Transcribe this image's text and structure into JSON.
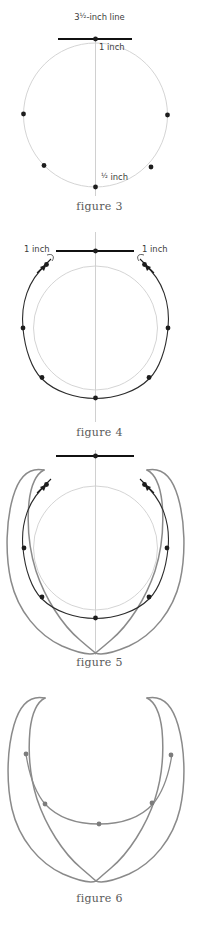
{
  "document": {
    "title": "Necklace pattern construction diagram",
    "kind": "craft-instruction-figures",
    "page_background": "#ffffff"
  },
  "palette": {
    "guide_circle": "#cfcfcf",
    "center_axis": "#c4c4c4",
    "bead_dot": "#1d1d1d",
    "bead_dot_gray": "#7c7c7c",
    "heavy_line": "#111111",
    "arc_line": "#2b2b2b",
    "outline_gray": "#8a8a8a",
    "caption_text": "#5a5a5a",
    "label_text": "#3b3b3b"
  },
  "figures": [
    {
      "id": "figure-3",
      "caption": "figure 3",
      "labels": {
        "top_line": "3½-inch line",
        "top_line_whole": "3",
        "top_line_fraction": "½",
        "top_line_suffix": "-inch line",
        "inch_one": "1 inch",
        "inch_half_fraction": "½",
        "inch_half_suffix": " inch"
      },
      "elements": {
        "guide_circle_radius_px": 72,
        "heavy_rule_length_px": 74,
        "dot_count": 6
      }
    },
    {
      "id": "figure-4",
      "caption": "figure 4",
      "labels": {
        "left_inch": "1 inch",
        "right_inch": "1 inch"
      },
      "elements": {
        "guide_circle_radius_px": 62,
        "outer_arc": true,
        "arrow_count": 2,
        "dot_count": 6
      }
    },
    {
      "id": "figure-5",
      "caption": "figure 5",
      "labels": {},
      "elements": {
        "guide_circle_radius_px": 62,
        "outer_teardrop_outline": true,
        "arrow_count": 2,
        "dot_count": 6
      }
    },
    {
      "id": "figure-6",
      "caption": "figure 6",
      "labels": {},
      "elements": {
        "outline_only": true,
        "dot_count": 5
      }
    }
  ]
}
